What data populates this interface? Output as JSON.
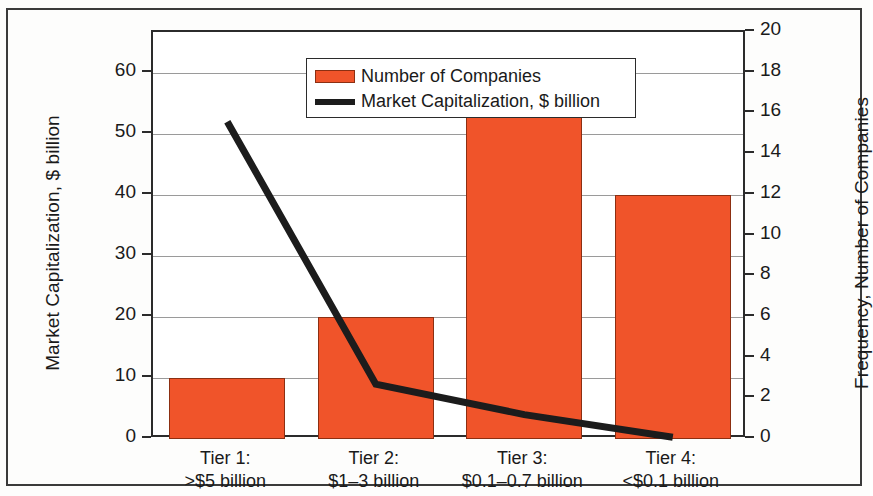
{
  "chart_data": {
    "type": "bar",
    "title": "",
    "subtitle": "",
    "xlabel": "",
    "ylabel": "Market Capitalization, $ billion",
    "y2label": "Frequency, Number of Companies",
    "grid": true,
    "legend_position": "top-left",
    "categories": [
      "Tier 1:\n>$5 billion",
      "Tier 2:\n$1–3 billion",
      "Tier 3:\n$0.1–0.7 billion",
      "Tier 4:\n<$0.1 billion"
    ],
    "category_lines": [
      [
        "Tier 1:",
        ">$5 billion"
      ],
      [
        "Tier 2:",
        "$1–3 billion"
      ],
      [
        "Tier 3:",
        "$0.1–0.7 billion"
      ],
      [
        "Tier 4:",
        "<$0.1 billion"
      ]
    ],
    "series": [
      {
        "name": "Number of Companies",
        "type": "bar",
        "axis": "right",
        "color": "#f0542a",
        "values": [
          3,
          6,
          16,
          12
        ]
      },
      {
        "name": "Market Capitalization, $ billion",
        "type": "line",
        "axis": "left",
        "color": "#1c1c1c",
        "values": [
          52,
          9,
          4,
          0.3
        ]
      }
    ],
    "ylim": [
      0,
      66.7
    ],
    "y2lim": [
      0,
      20
    ],
    "yticks": [
      0,
      10,
      20,
      30,
      40,
      50,
      60
    ],
    "y2ticks": [
      0,
      2,
      4,
      6,
      8,
      10,
      12,
      14,
      16,
      18,
      20
    ],
    "ytick_labels": [
      "0",
      "10",
      "20",
      "30",
      "40",
      "50",
      "60"
    ],
    "y2tick_labels": [
      "0",
      "2",
      "4",
      "6",
      "8",
      "10",
      "12",
      "14",
      "16",
      "18",
      "20"
    ]
  },
  "legend": {
    "items": [
      {
        "label": "Number of Companies",
        "marker": "bar-swatch",
        "color": "#f0542a"
      },
      {
        "label": "Market Capitalization, $ billion",
        "marker": "line-swatch",
        "color": "#1c1c1c"
      }
    ]
  },
  "axes": {
    "left_title": "Market Capitalization, $ billion",
    "right_title": "Frequency, Number of Companies"
  },
  "colors": {
    "bar_fill": "#f0542a",
    "bar_stroke": "#8c2f12",
    "line": "#1c1c1c",
    "gridline": "#9a9a9a",
    "axis": "#2b2b2b",
    "frame": "#3a3a3a",
    "background": "#fdfdfc"
  }
}
